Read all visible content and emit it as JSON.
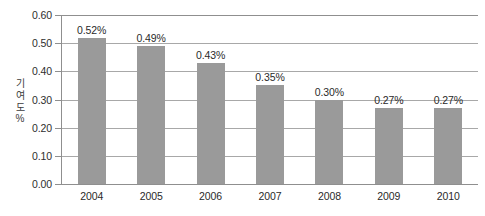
{
  "chart_data": {
    "type": "bar",
    "title": "",
    "xlabel": "",
    "ylabel": "기여도 %",
    "ylabel_chars": [
      "기",
      "여",
      "도",
      "%"
    ],
    "categories": [
      "2004",
      "2005",
      "2006",
      "2007",
      "2008",
      "2009",
      "2010"
    ],
    "values": [
      0.52,
      0.49,
      0.43,
      0.35,
      0.3,
      0.27,
      0.27
    ],
    "value_labels": [
      "0.52%",
      "0.49%",
      "0.43%",
      "0.35%",
      "0.30%",
      "0.27%",
      "0.27%"
    ],
    "ylim": [
      0.0,
      0.6
    ],
    "ytick_labels": [
      "0.00",
      "0.10",
      "0.20",
      "0.30",
      "0.40",
      "0.50",
      "0.60"
    ],
    "ytick_values": [
      0.0,
      0.1,
      0.2,
      0.3,
      0.4,
      0.5,
      0.6
    ],
    "grid": true,
    "legend": false,
    "legend_position": "none",
    "series": [
      {
        "name": "기여도",
        "values": [
          0.52,
          0.49,
          0.43,
          0.35,
          0.3,
          0.27,
          0.27
        ]
      }
    ],
    "colors": {
      "bar_fill": "#9a9a9a",
      "gridline": "#a8a8a8",
      "axis": "#8f8f8f",
      "text": "#2a2a2a",
      "background": "#ffffff"
    }
  }
}
